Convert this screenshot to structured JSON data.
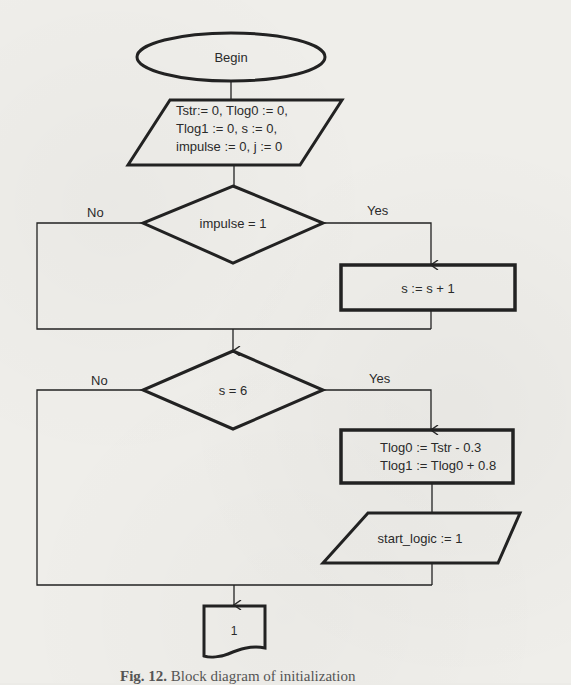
{
  "diagram": {
    "type": "flowchart",
    "nodes": {
      "begin": {
        "shape": "terminator",
        "label": "Begin"
      },
      "init": {
        "shape": "data",
        "lines": [
          "Tstr:= 0, Tlog0 := 0,",
          "Tlog1 := 0, s := 0,",
          "impulse := 0, j := 0"
        ]
      },
      "cond_impulse": {
        "shape": "decision",
        "label": "impulse = 1",
        "no": "No",
        "yes": "Yes"
      },
      "inc_s": {
        "shape": "process",
        "label": "s := s + 1"
      },
      "cond_s": {
        "shape": "decision",
        "label": "s = 6",
        "no": "No",
        "yes": "Yes"
      },
      "set_tlog": {
        "shape": "process",
        "lines": [
          "Tlog0 := Tstr - 0.3",
          "Tlog1 := Tlog0 + 0.8"
        ]
      },
      "start_logic": {
        "shape": "data",
        "label": "start_logic := 1"
      },
      "connector": {
        "shape": "off-page-connector",
        "label": "1"
      }
    },
    "caption": {
      "prefix": "Fig. 12.",
      "text": "Block diagram of initialization"
    }
  }
}
